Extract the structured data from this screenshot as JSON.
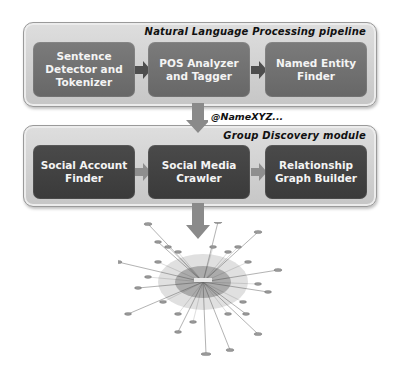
{
  "pipeline": {
    "title": "Natural Language Processing pipeline",
    "stages": [
      {
        "label": "Sentence Detector and Tokenizer"
      },
      {
        "label": "POS Analyzer and Tagger"
      },
      {
        "label": "Named Entity Finder"
      }
    ]
  },
  "connector": {
    "label": "@NameXYZ..."
  },
  "module": {
    "title": "Group Discovery module",
    "stages": [
      {
        "label": "Social Account Finder"
      },
      {
        "label": "Social Media Crawler"
      },
      {
        "label": "Relationship Graph Builder"
      }
    ]
  },
  "output": {
    "graph_icon": "network-graph-icon"
  },
  "colors": {
    "panel_bg": "#d2d2d2",
    "top_box": "#727272",
    "bottom_box": "#424242",
    "arrow": "#8a8a8a",
    "text_light": "#f4f4f4",
    "text_dark": "#111111"
  }
}
